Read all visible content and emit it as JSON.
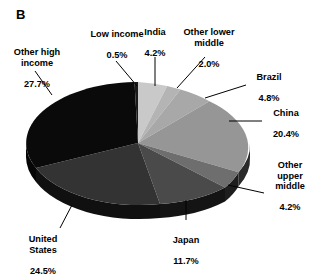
{
  "panel": {
    "label": "B"
  },
  "chart_data": {
    "type": "pie",
    "title": "",
    "three_d": true,
    "total_percent": 100.0,
    "start_angle_deg": 0,
    "direction": "clockwise",
    "labels": [
      "India",
      "Other lower middle",
      "Brazil",
      "China",
      "Other upper middle",
      "Japan",
      "United States",
      "Other high income",
      "Low income"
    ],
    "values": [
      4.2,
      2.0,
      4.8,
      20.4,
      4.2,
      11.7,
      24.5,
      27.7,
      0.5
    ],
    "value_labels": [
      "4.2%",
      "2.0%",
      "4.8%",
      "20.4%",
      "4.2%",
      "11.7%",
      "24.5%",
      "27.7%",
      "0.5%"
    ],
    "slices": [
      {
        "name": "India",
        "value": 4.2,
        "value_label": "4.2%",
        "color": "#c9c9c9",
        "side_color": "#7d7d7d"
      },
      {
        "name": "Other lower middle",
        "value": 2.0,
        "value_label": "2.0%",
        "color": "#b4b4b4",
        "side_color": "#6f6f6f"
      },
      {
        "name": "Brazil",
        "value": 4.8,
        "value_label": "4.8%",
        "color": "#a8a8a8",
        "side_color": "#686868"
      },
      {
        "name": "China",
        "value": 20.4,
        "value_label": "20.4%",
        "color": "#969696",
        "side_color": "#2a2a2a"
      },
      {
        "name": "Other upper middle",
        "value": 4.2,
        "value_label": "4.2%",
        "color": "#6e6e6e",
        "side_color": "#1e1e1e"
      },
      {
        "name": "Japan",
        "value": 11.7,
        "value_label": "11.7%",
        "color": "#4a4a4a",
        "side_color": "#141414"
      },
      {
        "name": "United States",
        "value": 24.5,
        "value_label": "24.5%",
        "color": "#333333",
        "side_color": "#101010"
      },
      {
        "name": "Other high income",
        "value": 27.7,
        "value_label": "27.7%",
        "color": "#0a0a0a",
        "side_color": "#060606"
      },
      {
        "name": "Low income",
        "value": 0.5,
        "value_label": "0.5%",
        "color": "#1a1a1a",
        "side_color": "#0d0d0d"
      }
    ],
    "legend": "none",
    "label_style": "outside-with-leader-lines"
  },
  "labels": {
    "low_income": {
      "name": "Low income",
      "value": "0.5%"
    },
    "india": {
      "name": "India",
      "value": "4.2%"
    },
    "other_lower_middle": {
      "name": "Other lower\nmiddle",
      "value": "2.0%"
    },
    "brazil": {
      "name": "Brazil",
      "value": "4.8%"
    },
    "china": {
      "name": "China",
      "value": "20.4%"
    },
    "other_upper_middle": {
      "name": "Other\nupper\nmiddle",
      "value": "4.2%"
    },
    "japan": {
      "name": "Japan",
      "value": "11.7%"
    },
    "united_states": {
      "name": "United\nStates",
      "value": "24.5%"
    },
    "other_high_income": {
      "name": "Other high\nincome",
      "value": "27.7%"
    }
  }
}
